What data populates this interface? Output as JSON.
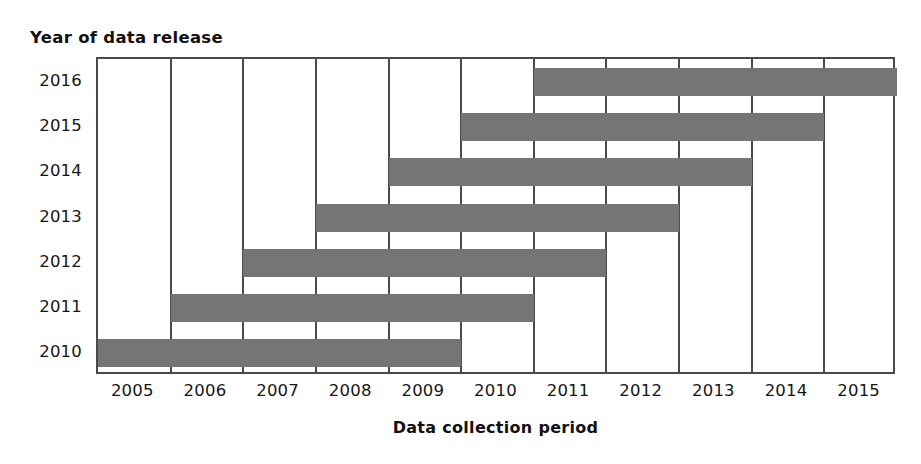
{
  "chart_data": {
    "type": "bar",
    "orientation": "horizontal",
    "subtype": "gantt-range",
    "title": "",
    "ylabel": "Year of data release",
    "xlabel": "Data collection period",
    "categories": [
      "2016",
      "2015",
      "2014",
      "2013",
      "2012",
      "2011",
      "2010"
    ],
    "x_tick_labels": [
      "2005",
      "2006",
      "2007",
      "2008",
      "2009",
      "2010",
      "2011",
      "2012",
      "2013",
      "2014",
      "2015"
    ],
    "xlim": [
      2004.5,
      2015.5
    ],
    "grid": "vertical",
    "legend": "none",
    "bar_color": "#757575",
    "axis_color": "#4a4a4a",
    "bars": [
      {
        "category": "2016",
        "start": 2010.5,
        "end": 2015.5,
        "label": "2016: mid-2010 to mid-2015"
      },
      {
        "category": "2015",
        "start": 2009.5,
        "end": 2014.5,
        "label": "2015: mid-2009 to mid-2014"
      },
      {
        "category": "2014",
        "start": 2008.5,
        "end": 2013.5,
        "label": "2014: mid-2008 to mid-2013"
      },
      {
        "category": "2013",
        "start": 2007.5,
        "end": 2012.5,
        "label": "2013: mid-2007 to mid-2012"
      },
      {
        "category": "2012",
        "start": 2006.5,
        "end": 2011.5,
        "label": "2012: mid-2006 to mid-2011"
      },
      {
        "category": "2011",
        "start": 2005.5,
        "end": 2010.5,
        "label": "2011: mid-2005 to mid-2010"
      },
      {
        "category": "2010",
        "start": 2004.5,
        "end": 2009.5,
        "label": "2010: mid-2004 to mid-2009"
      }
    ]
  },
  "axes": {
    "y_title": "Year of data release",
    "x_title": "Data collection period"
  }
}
